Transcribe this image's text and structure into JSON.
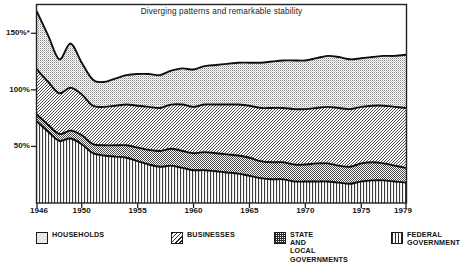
{
  "chart_data": {
    "type": "area",
    "stacked": true,
    "title": "Diverging patterns and remarkable stability",
    "xlabel": "",
    "ylabel": "",
    "grid": false,
    "legend_position": "bottom",
    "xlim": [
      1946,
      1979
    ],
    "ylim": [
      0,
      175
    ],
    "yticks": [
      50,
      100,
      150
    ],
    "ytick_labels": [
      "50%",
      "100%",
      "150%*"
    ],
    "xticks": [
      1946,
      1950,
      1955,
      1960,
      1965,
      1970,
      1975,
      1979
    ],
    "xtick_labels": [
      "1946",
      "1950",
      "1955",
      "1960",
      "1965",
      "1970",
      "1975",
      "1979"
    ],
    "x": [
      1946,
      1947,
      1948,
      1949,
      1950,
      1951,
      1952,
      1953,
      1954,
      1955,
      1956,
      1957,
      1958,
      1959,
      1960,
      1961,
      1962,
      1963,
      1964,
      1965,
      1966,
      1967,
      1968,
      1969,
      1970,
      1971,
      1972,
      1973,
      1974,
      1975,
      1976,
      1977,
      1978,
      1979
    ],
    "series": [
      {
        "name": "FEDERAL GOVERNMENT",
        "pattern": "vertical-lines",
        "values": [
          72,
          63,
          55,
          57,
          52,
          44,
          42,
          41,
          40,
          37,
          34,
          32,
          33,
          31,
          29,
          29,
          28,
          27,
          26,
          24,
          22,
          21,
          21,
          19,
          19,
          19,
          19,
          18,
          17,
          19,
          20,
          20,
          19,
          18
        ]
      },
      {
        "name": "STATE AND LOCAL GOVERNMENTS",
        "pattern": "cross-hatch",
        "values": [
          6,
          6,
          6,
          7,
          8,
          8,
          9,
          10,
          11,
          12,
          13,
          14,
          15,
          15,
          15,
          16,
          16,
          16,
          16,
          16,
          15,
          15,
          15,
          15,
          15,
          16,
          16,
          15,
          15,
          16,
          16,
          15,
          14,
          13
        ]
      },
      {
        "name": "BUSINESSES",
        "pattern": "diagonal-hatch",
        "values": [
          40,
          38,
          36,
          38,
          36,
          34,
          34,
          35,
          36,
          37,
          38,
          38,
          39,
          41,
          41,
          42,
          43,
          44,
          45,
          46,
          47,
          48,
          48,
          49,
          49,
          49,
          50,
          51,
          51,
          50,
          50,
          51,
          52,
          53
        ]
      },
      {
        "name": "HOUSEHOLDS",
        "pattern": "stipple-dots",
        "values": [
          51,
          41,
          30,
          39,
          28,
          23,
          22,
          24,
          26,
          28,
          29,
          29,
          30,
          32,
          33,
          34,
          35,
          36,
          37,
          38,
          40,
          41,
          42,
          43,
          43,
          44,
          45,
          45,
          44,
          43,
          43,
          44,
          45,
          47
        ]
      }
    ],
    "series_totals": [
      169,
      148,
      127,
      141,
      124,
      109,
      107,
      110,
      113,
      114,
      114,
      113,
      117,
      119,
      118,
      121,
      122,
      123,
      124,
      124,
      124,
      125,
      126,
      126,
      126,
      128,
      130,
      129,
      127,
      128,
      129,
      130,
      130,
      131
    ],
    "colors": {
      "outline": "#111111",
      "frame": "#222222",
      "background": "#ffffff"
    }
  },
  "legend": {
    "items": [
      {
        "label": "HOUSEHOLDS",
        "swatch": "sw-households",
        "icon": "households-swatch-icon"
      },
      {
        "label": "BUSINESSES",
        "swatch": "sw-businesses",
        "icon": "businesses-swatch-icon"
      },
      {
        "label": "STATE\nAND\nLOCAL\nGOVERNMENTS",
        "swatch": "sw-state",
        "icon": "state-local-swatch-icon"
      },
      {
        "label": "FEDERAL\nGOVERNMENT",
        "swatch": "sw-federal",
        "icon": "federal-swatch-icon"
      }
    ]
  }
}
